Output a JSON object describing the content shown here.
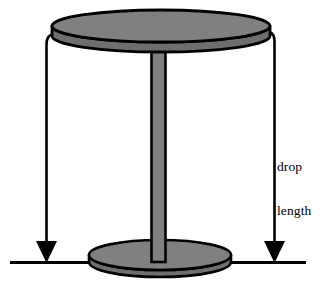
{
  "figure": {
    "annotations": {
      "drop_length": {
        "line_1": "drop",
        "line_2": "length",
        "full_text": "drop length"
      }
    },
    "colors": {
      "object_fill": "#808080",
      "object_fill_shadow": "#6e6e6e",
      "outline": "#000000",
      "background": "#ffffff",
      "dimension_line": "#000000"
    },
    "parts": [
      {
        "name": "table-top",
        "shape": "ellipse-with-thickness"
      },
      {
        "name": "table-stem",
        "shape": "vertical-column"
      },
      {
        "name": "table-base",
        "shape": "ellipse-with-thickness"
      },
      {
        "name": "ground-line",
        "shape": "horizontal-line"
      },
      {
        "name": "dimension-arrow-left",
        "shape": "down-arrow"
      },
      {
        "name": "dimension-arrow-right",
        "shape": "down-arrow"
      }
    ],
    "geometry": {
      "top_ellipse": {
        "cx": 161,
        "cy": 26,
        "rx": 109,
        "ry": 16,
        "thickness": 10
      },
      "base_ellipse": {
        "cx": 160,
        "cy": 255,
        "rx": 71,
        "ry": 15,
        "thickness": 7
      },
      "stem": {
        "x": 151,
        "width": 15,
        "top": 40,
        "bottom": 262
      },
      "ground_line": {
        "x1": 10,
        "x2": 306,
        "y": 262
      },
      "left_dimension": {
        "x": 46,
        "y_top": 38,
        "y_bottom": 262
      },
      "right_dimension": {
        "x": 274,
        "y_top": 34,
        "y_bottom": 262
      }
    }
  }
}
